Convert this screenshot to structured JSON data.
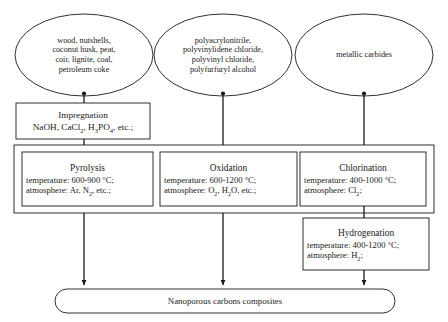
{
  "diagram": {
    "type": "process-flowchart",
    "sources": [
      {
        "id": "biomass",
        "shape": "ellipse",
        "lines": [
          "wood, nutshells,",
          "coconut husk, peat,",
          "coir, lignite, coal,",
          "petroleum coke"
        ]
      },
      {
        "id": "polymers",
        "shape": "ellipse",
        "lines": [
          "polyacrylonitrile,",
          "polyvinylidene chloride,",
          "polyvinyl chloride,",
          "polyfurfuryl alcohol"
        ]
      },
      {
        "id": "carbides",
        "shape": "ellipse",
        "lines": [
          "metallic carbides"
        ]
      }
    ],
    "pretreatment": {
      "id": "impregnation",
      "shape": "rectangle",
      "title": "Impregnation",
      "reagents_html": "NaOH, CaCl<sub>2</sub>, H<sub>3</sub>PO<sub>4</sub>, etc.;"
    },
    "processes": [
      {
        "id": "pyrolysis",
        "shape": "rectangle",
        "title": "Pyrolysis",
        "temperature_label": "temperature: 600-900 °C;",
        "atmosphere_html": "atmosphere: Ar, N<sub>2</sub>, etc.;"
      },
      {
        "id": "oxidation",
        "shape": "rectangle",
        "title": "Oxidation",
        "temperature_label": "temperature: 600-1200 °C;",
        "atmosphere_html": "atmosphere: O<sub>2</sub>, H<sub>2</sub>O, etc.;"
      },
      {
        "id": "chlorination",
        "shape": "rectangle",
        "title": "Chlorination",
        "temperature_label": "temperature: 400-1000 °C;",
        "atmosphere_html": "atmosphere: Cl<sub>2</sub>;"
      }
    ],
    "post_process": {
      "id": "hydrogenation",
      "shape": "rectangle",
      "title": "Hydrogenation",
      "temperature_label": "temperature: 400-1200 °C;",
      "atmosphere_html": "atmosphere: H<sub>2</sub>;"
    },
    "output": {
      "id": "product",
      "shape": "rounded-rectangle",
      "label": "Nanoporous carbons composites"
    },
    "style": {
      "line_color": "#1a1a1a",
      "fill_color": "#ffffff",
      "text_color": "#1a1a1a"
    }
  }
}
